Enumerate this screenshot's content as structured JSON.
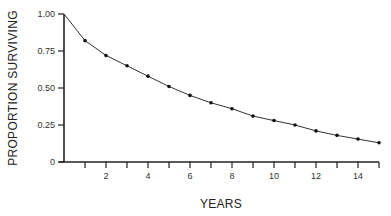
{
  "chart_data": {
    "type": "line",
    "title": "",
    "xlabel": "YEARS",
    "ylabel": "PROPORTION SURVIVING",
    "xlim": [
      0,
      15
    ],
    "ylim": [
      0,
      1.0
    ],
    "grid": false,
    "legend": null,
    "x_ticks": [
      1,
      2,
      3,
      4,
      5,
      6,
      7,
      8,
      9,
      10,
      11,
      12,
      13,
      14,
      15
    ],
    "x_tick_labels": [
      "2",
      "4",
      "6",
      "8",
      "10",
      "12",
      "14"
    ],
    "x_tick_label_values": [
      2,
      4,
      6,
      8,
      10,
      12,
      14
    ],
    "y_ticks": [
      0,
      0.25,
      0.5,
      0.75,
      1.0
    ],
    "y_tick_labels": [
      "0",
      "0.25",
      "0.50",
      "0.75",
      "1.00"
    ],
    "series": [
      {
        "name": "Proportion surviving",
        "x": [
          0,
          1,
          2,
          3,
          4,
          5,
          6,
          7,
          8,
          9,
          10,
          11,
          12,
          13,
          14,
          15
        ],
        "values": [
          1.0,
          0.82,
          0.72,
          0.65,
          0.58,
          0.51,
          0.45,
          0.4,
          0.36,
          0.31,
          0.28,
          0.25,
          0.21,
          0.18,
          0.155,
          0.13
        ],
        "markers": true
      }
    ]
  },
  "colors": {
    "line": "#333333",
    "axis": "#222222",
    "background": "#ffffff"
  }
}
